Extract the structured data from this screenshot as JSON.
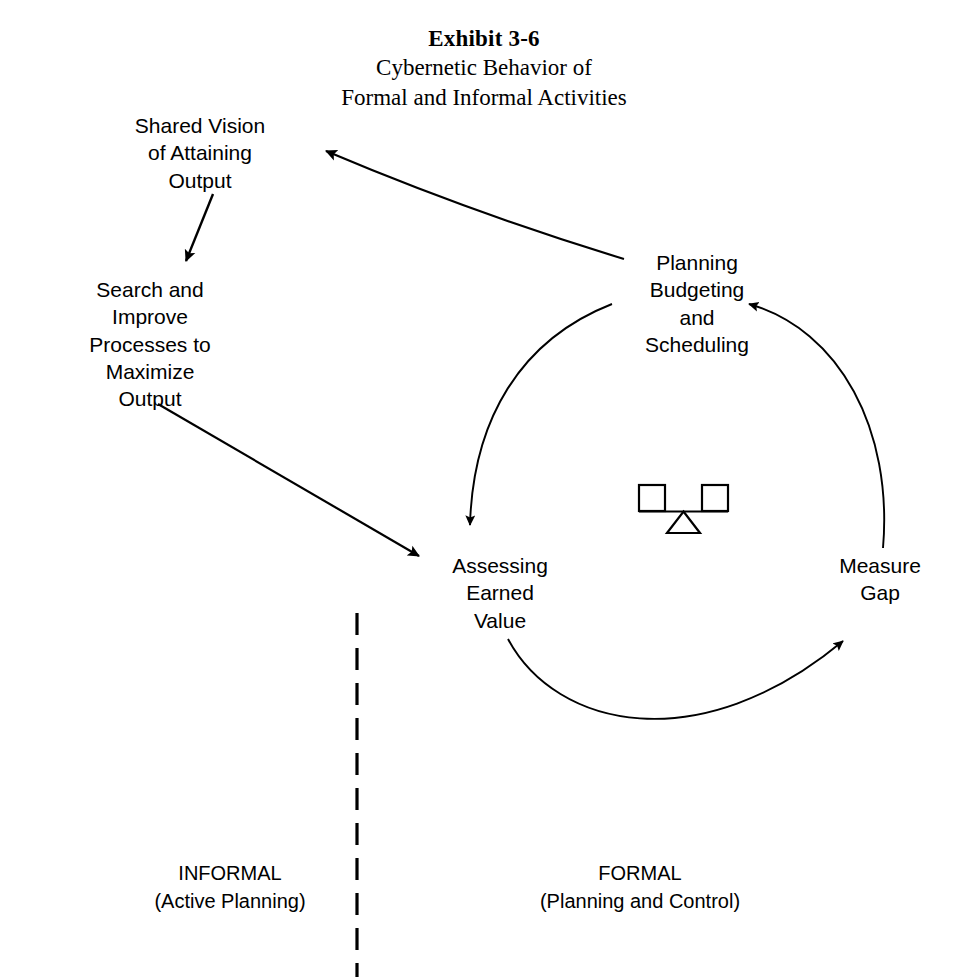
{
  "title": {
    "exhibit": "Exhibit 3-6",
    "line1": "Cybernetic Behavior of",
    "line2": "Formal and Informal Activities"
  },
  "nodes": {
    "shared_vision": "Shared Vision\nof Attaining\nOutput",
    "search_improve": "Search and\nImprove\nProcesses to\nMaximize\nOutput",
    "planning_budgeting": "Planning\nBudgeting\nand\nScheduling",
    "assessing_earned_value": "Assessing\nEarned\nValue",
    "measure_gap": "Measure\nGap"
  },
  "zones": {
    "informal": "INFORMAL\n(Active Planning)",
    "formal": "FORMAL\n(Planning and Control)"
  },
  "icons": {
    "balance": "balance-scale-icon"
  },
  "colors": {
    "stroke": "#000000",
    "background": "#ffffff",
    "text": "#000000"
  },
  "edges": [
    {
      "name": "planning-to-shared-vision",
      "from": "planning_budgeting",
      "to": "shared_vision",
      "style": "straight"
    },
    {
      "name": "shared-vision-to-search",
      "from": "shared_vision",
      "to": "search_improve",
      "style": "straight"
    },
    {
      "name": "search-to-assessing",
      "from": "search_improve",
      "to": "assessing_earned_value",
      "style": "straight"
    },
    {
      "name": "planning-to-assessing",
      "from": "planning_budgeting",
      "to": "assessing_earned_value",
      "style": "curved"
    },
    {
      "name": "assessing-to-measure-gap",
      "from": "assessing_earned_value",
      "to": "measure_gap",
      "style": "curved"
    },
    {
      "name": "measure-gap-to-planning",
      "from": "measure_gap",
      "to": "planning_budgeting",
      "style": "curved"
    }
  ],
  "divider": {
    "name": "informal-formal-divider",
    "style": "dashed-vertical"
  }
}
